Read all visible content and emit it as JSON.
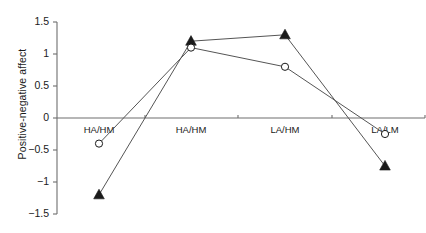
{
  "chart_data": {
    "type": "line",
    "title": "",
    "xlabel": "",
    "ylabel": "Positive-negative affect",
    "categories": [
      "HA/HM",
      "HA/HM",
      "LA/HM",
      "LA/LM"
    ],
    "ylim": [
      -1.5,
      1.5
    ],
    "yticks": [
      "1.5",
      "1",
      "0.5",
      "0",
      "-0.5",
      "-1",
      "-1.5"
    ],
    "ytick_values": [
      1.5,
      1,
      0.5,
      0,
      -0.5,
      -1,
      -1.5
    ],
    "grid": false,
    "legend": "none",
    "zero_line": true,
    "series": [
      {
        "name": "filled-triangle-series",
        "marker": "triangle-filled",
        "color": "#1a1a1a",
        "values": [
          -1.2,
          1.2,
          1.3,
          -0.75
        ]
      },
      {
        "name": "open-circle-series",
        "marker": "circle-open",
        "color": "#1a1a1a",
        "values": [
          -0.4,
          1.1,
          0.8,
          -0.25
        ]
      }
    ]
  },
  "colors": {
    "axis": "#6e6e6e",
    "line": "#555555",
    "marker": "#1a1a1a",
    "text": "#1a1a1a",
    "background": "#ffffff"
  }
}
